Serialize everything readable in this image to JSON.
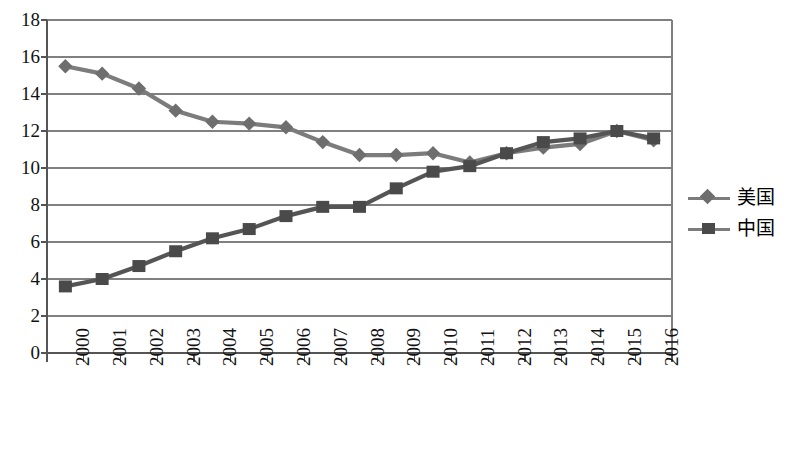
{
  "chart_data": {
    "type": "line",
    "title": "",
    "subtitle": "",
    "xlabel": "",
    "ylabel": "",
    "ylim": [
      0,
      18
    ],
    "ytick_step": 2,
    "yticks": [
      "18",
      "16",
      "14",
      "12",
      "10",
      "8",
      "6",
      "4",
      "2",
      "0"
    ],
    "grid": true,
    "grid_axis": "y",
    "legend_position": "right",
    "categories": [
      "2000",
      "2001",
      "2002",
      "2003",
      "2004",
      "2005",
      "2006",
      "2007",
      "2008",
      "2009",
      "2010",
      "2011",
      "2012",
      "2013",
      "2014",
      "2015",
      "2016"
    ],
    "series": [
      {
        "name": "美国",
        "marker": "diamond",
        "color": "#6e6e6e",
        "line_color": "#7c7c7c",
        "values": [
          15.5,
          15.1,
          14.3,
          13.1,
          12.5,
          12.4,
          12.2,
          11.4,
          10.7,
          10.7,
          10.8,
          10.3,
          10.8,
          11.1,
          11.3,
          12.0,
          11.5
        ]
      },
      {
        "name": "中国",
        "marker": "square",
        "color": "#4a4a4a",
        "line_color": "#555555",
        "values": [
          3.6,
          4.0,
          4.7,
          5.5,
          6.2,
          6.7,
          7.4,
          7.9,
          7.9,
          8.9,
          9.8,
          10.1,
          10.8,
          11.4,
          11.6,
          12.0,
          11.6
        ]
      }
    ]
  },
  "legend": {
    "items": [
      {
        "label": "美国",
        "marker": "diamond-marker-icon"
      },
      {
        "label": "中国",
        "marker": "square-marker-icon"
      }
    ]
  },
  "colors": {
    "series_us": "#6e6e6e",
    "series_cn": "#4a4a4a",
    "gridline": "#808080",
    "axis": "#555555",
    "background": "#ffffff"
  }
}
